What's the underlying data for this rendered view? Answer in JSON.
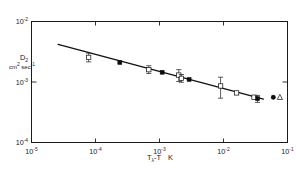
{
  "chart_data": {
    "type": "scatter",
    "title": "",
    "subtitle": "",
    "xlabel": "Tλ-T   K",
    "xlabel_parts": {
      "base": "T",
      "sub": "λ",
      "rest": "-T",
      "unit": "K"
    },
    "ylabel": "D2",
    "ylabel_parts": {
      "base": "D",
      "sub": "2"
    },
    "yunit": "cm2 sec-1",
    "yunit_parts": {
      "a": "cm",
      "a_sup": "2",
      "b": " sec",
      "b_sup": "-1"
    },
    "xscale": "log",
    "yscale": "log",
    "xlim": [
      1e-05,
      0.1
    ],
    "ylim": [
      0.0001,
      0.01
    ],
    "grid": false,
    "legend": false,
    "xticks": [
      {
        "value": 1e-05,
        "mantissa": "10",
        "exponent": "-5"
      },
      {
        "value": 0.0001,
        "mantissa": "10",
        "exponent": "-4"
      },
      {
        "value": 0.001,
        "mantissa": "10",
        "exponent": "-3"
      },
      {
        "value": 0.01,
        "mantissa": "10",
        "exponent": "-2"
      },
      {
        "value": 0.1,
        "mantissa": "10",
        "exponent": "-1"
      }
    ],
    "yticks": [
      {
        "value": 0.01,
        "mantissa": "10",
        "exponent": "-2"
      },
      {
        "value": 0.001,
        "mantissa": "10",
        "exponent": "-3"
      },
      {
        "value": 0.0001,
        "mantissa": "10",
        "exponent": "-4"
      }
    ],
    "fit_line": {
      "x": [
        2.6e-05,
        0.042
      ],
      "y": [
        0.0042,
        0.00052
      ]
    },
    "series": [
      {
        "name": "open-square-with-errorbars",
        "marker": "open-square",
        "points": [
          {
            "x": 7.8e-05,
            "y": 0.00255,
            "yerr_lo": 0.0004,
            "yerr_hi": 0.00045
          },
          {
            "x": 0.00068,
            "y": 0.0016,
            "yerr_lo": 0.00022,
            "yerr_hi": 0.00026
          },
          {
            "x": 0.002,
            "y": 0.0013,
            "yerr_lo": 0.00028,
            "yerr_hi": 0.0003
          },
          {
            "x": 0.0022,
            "y": 0.00115,
            "yerr_lo": 0.00016,
            "yerr_hi": 0.00018
          },
          {
            "x": 0.009,
            "y": 0.00086,
            "yerr_lo": 0.00032,
            "yerr_hi": 0.00034
          },
          {
            "x": 0.016,
            "y": 0.00066,
            "yerr_lo": 0,
            "yerr_hi": 0
          },
          {
            "x": 0.03,
            "y": 0.00056,
            "yerr_lo": 0,
            "yerr_hi": 0
          }
        ]
      },
      {
        "name": "filled-square",
        "marker": "filled-square",
        "points": [
          {
            "x": 0.00024,
            "y": 0.0021,
            "yerr_lo": 0,
            "yerr_hi": 0
          },
          {
            "x": 0.0011,
            "y": 0.00145,
            "yerr_lo": 0,
            "yerr_hi": 0
          },
          {
            "x": 0.0029,
            "y": 0.0011,
            "yerr_lo": 0,
            "yerr_hi": 0
          },
          {
            "x": 0.034,
            "y": 0.00053,
            "yerr_lo": 7e-05,
            "yerr_hi": 7e-05
          }
        ]
      },
      {
        "name": "filled-circle-offline",
        "marker": "filled-circle",
        "points": [
          {
            "x": 0.06,
            "y": 0.00056,
            "yerr_lo": 0,
            "yerr_hi": 0
          }
        ]
      },
      {
        "name": "open-triangle-offline",
        "marker": "open-triangle",
        "points": [
          {
            "x": 0.076,
            "y": 0.00056,
            "yerr_lo": 0,
            "yerr_hi": 0
          }
        ]
      }
    ]
  },
  "figure": {
    "background_color": "#ffffff",
    "axis_color": "#1b1b1b",
    "line_color": "#101010",
    "marker_fill": "#0d0d0d"
  }
}
